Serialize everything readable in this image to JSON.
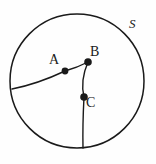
{
  "figure": {
    "background_color": "#fefefe",
    "stroke_color": "#1a1a1a",
    "point_color": "#1a1a1a",
    "stroke_width": 1.4,
    "canvas": {
      "width": 156,
      "height": 164
    }
  },
  "labels": {
    "region": "S",
    "point_a": "A",
    "point_b": "B",
    "point_c": "C"
  },
  "chart_data": {
    "type": "scatter",
    "xlabel": "",
    "ylabel": "",
    "xlim": [
      0,
      156
    ],
    "ylim": [
      0,
      164
    ],
    "grid": false,
    "legend": null,
    "shapes": [
      {
        "name": "boundary-circle",
        "kind": "circle",
        "cx": 77,
        "cy": 81,
        "r": 67,
        "fill": "none",
        "stroke": "#1a1a1a",
        "stroke_width": 1.5,
        "label": "S"
      },
      {
        "name": "arc-edge-to-a",
        "kind": "path",
        "description": "gently curved arc from circle boundary on the left to point A",
        "points": [
          [
            12,
            89
          ],
          [
            38,
            82
          ],
          [
            65,
            71
          ]
        ],
        "stroke": "#1a1a1a",
        "stroke_width": 1.4
      },
      {
        "name": "segment-a-to-b",
        "kind": "path",
        "description": "short slightly curved segment from A up-right to B",
        "points": [
          [
            65,
            71
          ],
          [
            77,
            67
          ],
          [
            88,
            62
          ]
        ],
        "stroke": "#1a1a1a",
        "stroke_width": 1.4
      },
      {
        "name": "segment-b-to-c",
        "kind": "path",
        "description": "slightly curved segment from B down-left to C",
        "points": [
          [
            88,
            62
          ],
          [
            83,
            80
          ],
          [
            84,
            97
          ]
        ],
        "stroke": "#1a1a1a",
        "stroke_width": 1.4
      },
      {
        "name": "segment-c-to-boundary",
        "kind": "path",
        "description": "near-vertical segment from C down to the circle boundary",
        "points": [
          [
            84,
            97
          ],
          [
            83,
            124
          ],
          [
            83,
            148
          ]
        ],
        "stroke": "#1a1a1a",
        "stroke_width": 1.4
      }
    ],
    "points": [
      {
        "name": "A",
        "x": 65,
        "y": 71,
        "r": 3.4,
        "label": "A",
        "label_x": 56,
        "label_y": 60
      },
      {
        "name": "B",
        "x": 88,
        "y": 62,
        "r": 3.8,
        "label": "B",
        "label_x": 97,
        "label_y": 52
      },
      {
        "name": "C",
        "x": 84,
        "y": 97,
        "r": 3.8,
        "label": "C",
        "label_x": 93,
        "label_y": 103
      }
    ],
    "annotations": [
      {
        "text": "S",
        "x": 133,
        "y": 25,
        "style": "italic"
      }
    ]
  }
}
